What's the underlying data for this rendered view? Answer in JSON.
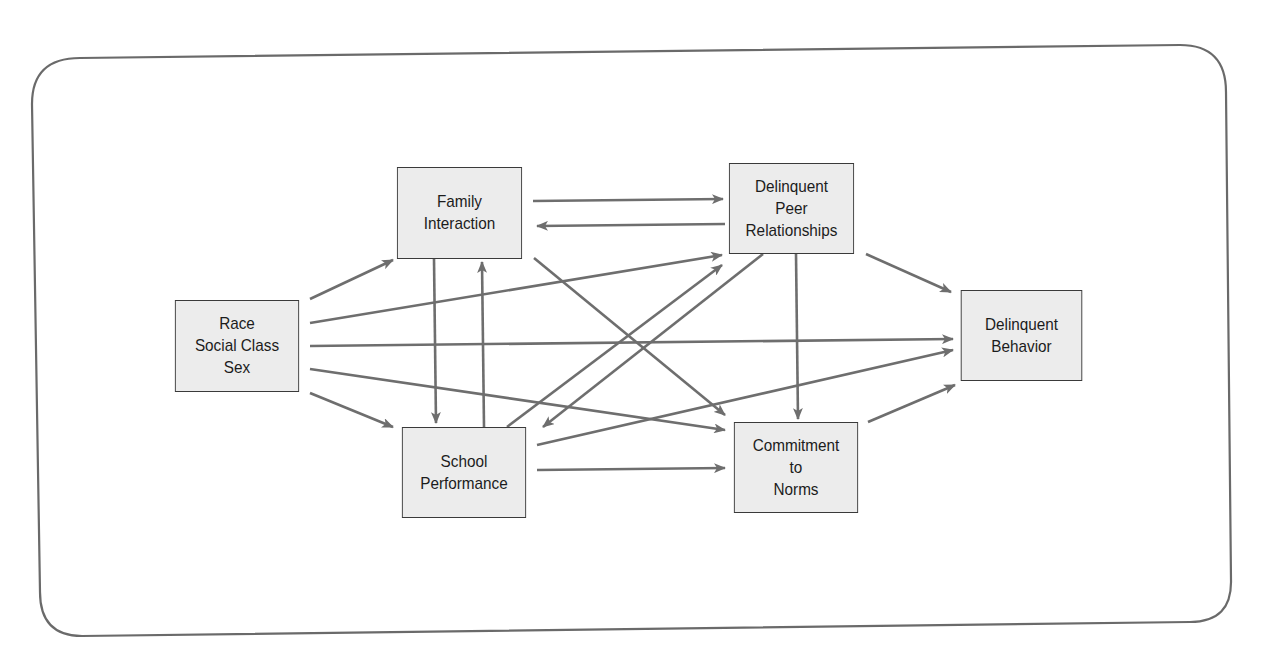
{
  "diagram": {
    "type": "path-model",
    "colors": {
      "frame_stroke": "#6a6a6a",
      "node_fill": "#ececec",
      "node_border": "#3a3a3a",
      "arrow": "#6e6e6e",
      "text": "#1c1c1c"
    },
    "nodes": {
      "race": {
        "lines": [
          "Race",
          "Social Class",
          "Sex"
        ]
      },
      "family": {
        "lines": [
          "Family",
          "Interaction"
        ]
      },
      "peer": {
        "lines": [
          "Delinquent",
          "Peer",
          "Relationships"
        ]
      },
      "school": {
        "lines": [
          "School",
          "Performance"
        ]
      },
      "commitment": {
        "lines": [
          "Commitment",
          "to",
          "Norms"
        ]
      },
      "behavior": {
        "lines": [
          "Delinquent",
          "Behavior"
        ]
      }
    },
    "edges": [
      {
        "from": "Race/Social Class/Sex",
        "to": "Family Interaction"
      },
      {
        "from": "Race/Social Class/Sex",
        "to": "Delinquent Peer Relationships"
      },
      {
        "from": "Race/Social Class/Sex",
        "to": "Delinquent Behavior"
      },
      {
        "from": "Race/Social Class/Sex",
        "to": "Commitment to Norms"
      },
      {
        "from": "Race/Social Class/Sex",
        "to": "School Performance"
      },
      {
        "from": "Family Interaction",
        "to": "Delinquent Peer Relationships"
      },
      {
        "from": "Delinquent Peer Relationships",
        "to": "Family Interaction"
      },
      {
        "from": "Family Interaction",
        "to": "School Performance"
      },
      {
        "from": "School Performance",
        "to": "Family Interaction"
      },
      {
        "from": "Family Interaction",
        "to": "Commitment to Norms"
      },
      {
        "from": "School Performance",
        "to": "Delinquent Peer Relationships"
      },
      {
        "from": "Delinquent Peer Relationships",
        "to": "School Performance"
      },
      {
        "from": "School Performance",
        "to": "Delinquent Behavior"
      },
      {
        "from": "School Performance",
        "to": "Commitment to Norms"
      },
      {
        "from": "Delinquent Peer Relationships",
        "to": "Commitment to Norms"
      },
      {
        "from": "Delinquent Peer Relationships",
        "to": "Delinquent Behavior"
      },
      {
        "from": "Commitment to Norms",
        "to": "Delinquent Behavior"
      }
    ]
  }
}
